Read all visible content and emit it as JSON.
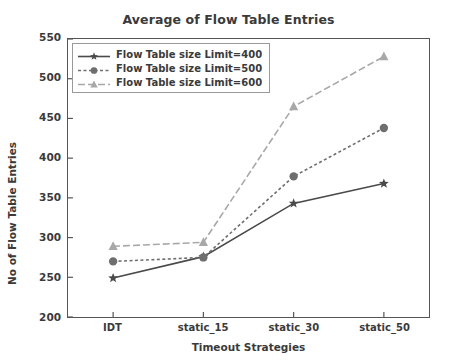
{
  "chart_data": {
    "type": "line",
    "title": "Average of Flow Table Entries",
    "xlabel": "Timeout Strategies",
    "ylabel": "No of Flow Table Entries",
    "categories": [
      "IDT",
      "static_15",
      "static_30",
      "static_50"
    ],
    "ylim": [
      200,
      550
    ],
    "yticks": [
      200,
      250,
      300,
      350,
      400,
      450,
      500,
      550
    ],
    "grid": false,
    "legend_position": "upper left",
    "series": [
      {
        "name": "Flow Table size Limit=400",
        "values": [
          249,
          276,
          343,
          368
        ],
        "color": "#4a4a4a",
        "linestyle": "solid",
        "marker": "star"
      },
      {
        "name": "Flow Table size Limit=500",
        "values": [
          270,
          275,
          377,
          438
        ],
        "color": "#6e6e6e",
        "linestyle": "dotted",
        "marker": "circle"
      },
      {
        "name": "Flow Table size Limit=600",
        "values": [
          289,
          294,
          465,
          528
        ],
        "color": "#a8a8a8",
        "linestyle": "dashdot",
        "marker": "triangle"
      }
    ]
  }
}
